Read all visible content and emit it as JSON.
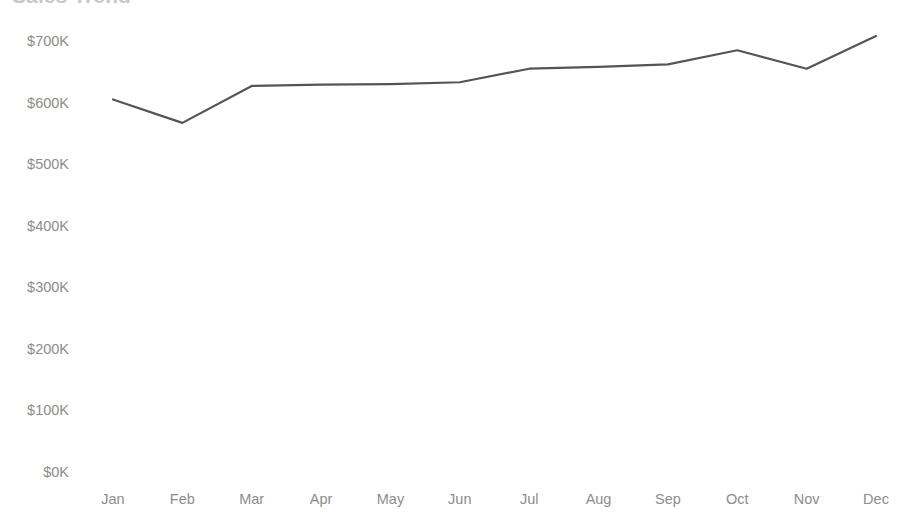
{
  "chart_data": {
    "type": "line",
    "title": "Sales Trend",
    "xlabel": "",
    "ylabel": "",
    "categories": [
      "Jan",
      "Feb",
      "Mar",
      "Apr",
      "May",
      "Jun",
      "Jul",
      "Aug",
      "Sep",
      "Oct",
      "Nov",
      "Dec"
    ],
    "values": [
      605000,
      567000,
      627000,
      629000,
      630000,
      633000,
      655000,
      658000,
      662000,
      685000,
      655000,
      708000
    ],
    "series": [
      {
        "name": "Sales",
        "values": [
          605000,
          567000,
          627000,
          629000,
          630000,
          633000,
          655000,
          658000,
          662000,
          685000,
          655000,
          708000
        ]
      }
    ],
    "ylim": [
      0,
      700000
    ],
    "ytick_values": [
      0,
      100000,
      200000,
      300000,
      400000,
      500000,
      600000,
      700000
    ],
    "ytick_labels": [
      "$0K",
      "$100K",
      "$200K",
      "$300K",
      "$400K",
      "$500K",
      "$600K",
      "$700K"
    ],
    "grid": false,
    "legend": null,
    "legend_position": "none",
    "annotations": [],
    "line_color": "#555555",
    "line_width": 2.2,
    "axis_label_color": "#8c8c8c",
    "background_color": "#ffffff"
  }
}
